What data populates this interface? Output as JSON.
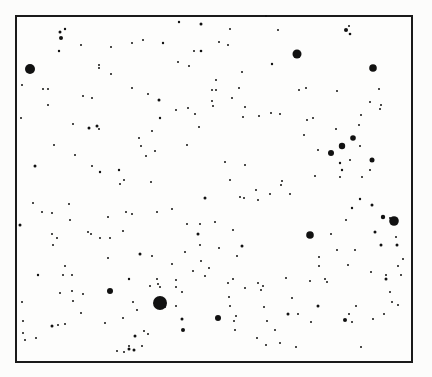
{
  "figure": {
    "type": "star-field",
    "background": "#fcfcfb",
    "ink": "#111111",
    "frame": {
      "x": 16,
      "y": 16,
      "width": 396,
      "height": 346
    }
  },
  "stars": [
    [
      30,
      69,
      5.0
    ],
    [
      297,
      54,
      4.5
    ],
    [
      373,
      68,
      3.8
    ],
    [
      160,
      303,
      7.0
    ],
    [
      394,
      221,
      4.8
    ],
    [
      310,
      235,
      3.8
    ],
    [
      110,
      291,
      3.0
    ],
    [
      218,
      318,
      3.0
    ],
    [
      342,
      146,
      3.2
    ],
    [
      331,
      153,
      3.0
    ],
    [
      353,
      138,
      2.8
    ],
    [
      372,
      160,
      2.5
    ],
    [
      60,
      32,
      1.5
    ],
    [
      61,
      38,
      2.0
    ],
    [
      65,
      29,
      1.2
    ],
    [
      179,
      22,
      1.2
    ],
    [
      201,
      24,
      1.5
    ],
    [
      230,
      29,
      1.0
    ],
    [
      266,
      16,
      1.0
    ],
    [
      278,
      30,
      1.0
    ],
    [
      346,
      30,
      2.0
    ],
    [
      350,
      34,
      1.3
    ],
    [
      349,
      26,
      1.0
    ],
    [
      59,
      51,
      1.2
    ],
    [
      81,
      45,
      1.0
    ],
    [
      111,
      47,
      1.0
    ],
    [
      132,
      43,
      1.0
    ],
    [
      143,
      40,
      1.0
    ],
    [
      163,
      43,
      1.2
    ],
    [
      194,
      51,
      1.0
    ],
    [
      201,
      51,
      1.3
    ],
    [
      219,
      42,
      1.0
    ],
    [
      228,
      45,
      1.0
    ],
    [
      99,
      65,
      1.0
    ],
    [
      99,
      68,
      1.0
    ],
    [
      178,
      62,
      1.0
    ],
    [
      189,
      66,
      1.0
    ],
    [
      216,
      80,
      1.0
    ],
    [
      216,
      90,
      1.0
    ],
    [
      272,
      64,
      1.2
    ],
    [
      111,
      74,
      1.0
    ],
    [
      159,
      100,
      1.5
    ],
    [
      43,
      89,
      1.0
    ],
    [
      48,
      89,
      1.0
    ],
    [
      22,
      85,
      1.0
    ],
    [
      132,
      88,
      1.0
    ],
    [
      148,
      94,
      1.0
    ],
    [
      83,
      96,
      1.0
    ],
    [
      92,
      98,
      1.0
    ],
    [
      89,
      128,
      1.5
    ],
    [
      97,
      126,
      1.5
    ],
    [
      99,
      129,
      1.0
    ],
    [
      73,
      124,
      1.0
    ],
    [
      54,
      145,
      1.0
    ],
    [
      75,
      155,
      1.0
    ],
    [
      92,
      166,
      1.0
    ],
    [
      100,
      172,
      1.2
    ],
    [
      119,
      170,
      1.2
    ],
    [
      124,
      180,
      1.0
    ],
    [
      120,
      184,
      1.0
    ],
    [
      21,
      118,
      1.0
    ],
    [
      48,
      105,
      1.0
    ],
    [
      35,
      166,
      1.5
    ],
    [
      152,
      131,
      1.0
    ],
    [
      139,
      138,
      1.0
    ],
    [
      146,
      156,
      1.0
    ],
    [
      141,
      146,
      1.0
    ],
    [
      155,
      151,
      1.0
    ],
    [
      151,
      182,
      1.0
    ],
    [
      160,
      118,
      1.2
    ],
    [
      176,
      110,
      1.0
    ],
    [
      188,
      108,
      1.0
    ],
    [
      187,
      145,
      1.0
    ],
    [
      212,
      101,
      1.0
    ],
    [
      212,
      90,
      1.0
    ],
    [
      213,
      106,
      1.0
    ],
    [
      195,
      114,
      1.0
    ],
    [
      199,
      127,
      1.0
    ],
    [
      242,
      72,
      1.0
    ],
    [
      239,
      88,
      1.0
    ],
    [
      232,
      98,
      1.0
    ],
    [
      245,
      107,
      1.0
    ],
    [
      243,
      117,
      1.0
    ],
    [
      259,
      116,
      1.0
    ],
    [
      271,
      113,
      1.0
    ],
    [
      280,
      114,
      1.0
    ],
    [
      299,
      90,
      1.0
    ],
    [
      306,
      88,
      1.0
    ],
    [
      307,
      120,
      1.0
    ],
    [
      313,
      118,
      1.0
    ],
    [
      336,
      129,
      1.0
    ],
    [
      304,
      135,
      1.0
    ],
    [
      318,
      150,
      1.0
    ],
    [
      340,
      163,
      1.2
    ],
    [
      342,
      170,
      1.2
    ],
    [
      340,
      177,
      1.0
    ],
    [
      350,
      160,
      1.0
    ],
    [
      360,
      146,
      1.0
    ],
    [
      359,
      125,
      1.0
    ],
    [
      361,
      115,
      1.0
    ],
    [
      380,
      109,
      1.0
    ],
    [
      370,
      102,
      1.0
    ],
    [
      381,
      105,
      1.0
    ],
    [
      379,
      89,
      1.0
    ],
    [
      337,
      91,
      1.0
    ],
    [
      370,
      170,
      1.0
    ],
    [
      362,
      177,
      1.0
    ],
    [
      230,
      180,
      1.0
    ],
    [
      225,
      162,
      1.0
    ],
    [
      245,
      165,
      1.0
    ],
    [
      282,
      181,
      1.0
    ],
    [
      281,
      185,
      1.0
    ],
    [
      315,
      176,
      1.0
    ],
    [
      258,
      200,
      1.0
    ],
    [
      244,
      198,
      1.0
    ],
    [
      205,
      198,
      1.5
    ],
    [
      240,
      197,
      1.0
    ],
    [
      256,
      190,
      1.0
    ],
    [
      270,
      194,
      1.0
    ],
    [
      290,
      194,
      1.0
    ],
    [
      33,
      203,
      1.0
    ],
    [
      42,
      212,
      1.0
    ],
    [
      52,
      213,
      1.0
    ],
    [
      20,
      225,
      1.5
    ],
    [
      69,
      204,
      1.0
    ],
    [
      52,
      234,
      1.0
    ],
    [
      57,
      238,
      1.0
    ],
    [
      53,
      245,
      1.0
    ],
    [
      88,
      232,
      1.0
    ],
    [
      91,
      234,
      1.0
    ],
    [
      100,
      238,
      1.0
    ],
    [
      110,
      238,
      1.0
    ],
    [
      123,
      231,
      1.0
    ],
    [
      108,
      217,
      1.0
    ],
    [
      70,
      220,
      1.0
    ],
    [
      126,
      212,
      1.0
    ],
    [
      132,
      214,
      1.0
    ],
    [
      157,
      212,
      1.0
    ],
    [
      140,
      254,
      1.5
    ],
    [
      172,
      209,
      1.0
    ],
    [
      187,
      224,
      1.0
    ],
    [
      200,
      224,
      1.0
    ],
    [
      198,
      234,
      1.5
    ],
    [
      215,
      222,
      1.0
    ],
    [
      108,
      258,
      1.0
    ],
    [
      63,
      275,
      1.0
    ],
    [
      72,
      275,
      1.0
    ],
    [
      38,
      275,
      1.2
    ],
    [
      65,
      266,
      1.0
    ],
    [
      60,
      293,
      1.0
    ],
    [
      72,
      291,
      1.0
    ],
    [
      83,
      294,
      1.0
    ],
    [
      73,
      301,
      1.0
    ],
    [
      129,
      279,
      1.2
    ],
    [
      157,
      279,
      1.0
    ],
    [
      158,
      284,
      1.0
    ],
    [
      150,
      286,
      1.0
    ],
    [
      160,
      287,
      1.0
    ],
    [
      176,
      287,
      1.0
    ],
    [
      182,
      292,
      1.0
    ],
    [
      176,
      280,
      1.0
    ],
    [
      22,
      302,
      1.0
    ],
    [
      23,
      321,
      1.0
    ],
    [
      23,
      333,
      1.0
    ],
    [
      58,
      325,
      1.0
    ],
    [
      52,
      326,
      1.5
    ],
    [
      65,
      324,
      1.0
    ],
    [
      36,
      338,
      1.0
    ],
    [
      25,
      340,
      1.0
    ],
    [
      117,
      351,
      1.0
    ],
    [
      124,
      352,
      1.0
    ],
    [
      129,
      349,
      1.5
    ],
    [
      134,
      350,
      1.5
    ],
    [
      135,
      336,
      1.5
    ],
    [
      129,
      346,
      1.0
    ],
    [
      142,
      346,
      1.0
    ],
    [
      148,
      334,
      1.0
    ],
    [
      165,
      307,
      1.0
    ],
    [
      182,
      319,
      1.5
    ],
    [
      183,
      330,
      2.0
    ],
    [
      176,
      306,
      1.0
    ],
    [
      228,
      283,
      1.0
    ],
    [
      242,
      246,
      1.5
    ],
    [
      237,
      256,
      1.0
    ],
    [
      233,
      230,
      1.0
    ],
    [
      245,
      288,
      1.0
    ],
    [
      258,
      283,
      1.0
    ],
    [
      263,
      286,
      1.0
    ],
    [
      233,
      279,
      1.0
    ],
    [
      229,
      297,
      1.0
    ],
    [
      230,
      306,
      1.0
    ],
    [
      234,
      321,
      1.0
    ],
    [
      236,
      316,
      1.0
    ],
    [
      235,
      330,
      1.0
    ],
    [
      261,
      290,
      1.0
    ],
    [
      264,
      307,
      1.0
    ],
    [
      267,
      321,
      1.0
    ],
    [
      298,
      314,
      1.0
    ],
    [
      280,
      343,
      1.0
    ],
    [
      266,
      345,
      1.0
    ],
    [
      319,
      257,
      1.0
    ],
    [
      319,
      266,
      1.0
    ],
    [
      318,
      306,
      1.5
    ],
    [
      325,
      279,
      1.0
    ],
    [
      327,
      282,
      1.0
    ],
    [
      348,
      265,
      1.0
    ],
    [
      355,
      250,
      1.0
    ],
    [
      346,
      220,
      1.0
    ],
    [
      331,
      234,
      1.0
    ],
    [
      352,
      208,
      1.2
    ],
    [
      337,
      250,
      1.0
    ],
    [
      360,
      199,
      1.2
    ],
    [
      372,
      205,
      1.5
    ],
    [
      383,
      217,
      2.2
    ],
    [
      390,
      218,
      1.0
    ],
    [
      381,
      245,
      1.5
    ],
    [
      375,
      232,
      1.5
    ],
    [
      396,
      237,
      1.0
    ],
    [
      403,
      259,
      1.0
    ],
    [
      397,
      245,
      1.5
    ],
    [
      398,
      266,
      1.0
    ],
    [
      386,
      279,
      1.5
    ],
    [
      371,
      272,
      1.0
    ],
    [
      390,
      292,
      1.0
    ],
    [
      356,
      306,
      1.0
    ],
    [
      352,
      322,
      1.0
    ],
    [
      349,
      314,
      1.0
    ],
    [
      345,
      320,
      2.0
    ],
    [
      373,
      319,
      1.0
    ],
    [
      386,
      275,
      1.0
    ],
    [
      401,
      275,
      1.0
    ],
    [
      384,
      314,
      1.0
    ],
    [
      392,
      302,
      1.0
    ],
    [
      310,
      281,
      1.0
    ],
    [
      286,
      278,
      1.0
    ],
    [
      288,
      314,
      1.5
    ],
    [
      292,
      298,
      1.0
    ],
    [
      311,
      322,
      1.0
    ],
    [
      257,
      338,
      1.0
    ],
    [
      275,
      330,
      1.0
    ],
    [
      296,
      347,
      1.0
    ],
    [
      361,
      347,
      1.0
    ],
    [
      398,
      305,
      1.0
    ],
    [
      193,
      271,
      1.0
    ],
    [
      201,
      261,
      1.0
    ],
    [
      209,
      268,
      1.0
    ],
    [
      205,
      276,
      1.0
    ],
    [
      219,
      248,
      1.0
    ],
    [
      200,
      245,
      1.0
    ],
    [
      185,
      252,
      1.0
    ],
    [
      172,
      264,
      1.0
    ],
    [
      152,
      256,
      1.0
    ],
    [
      133,
      302,
      1.0
    ],
    [
      137,
      310,
      1.0
    ],
    [
      144,
      331,
      1.0
    ],
    [
      105,
      323,
      1.0
    ],
    [
      123,
      318,
      1.0
    ],
    [
      81,
      313,
      1.0
    ]
  ]
}
